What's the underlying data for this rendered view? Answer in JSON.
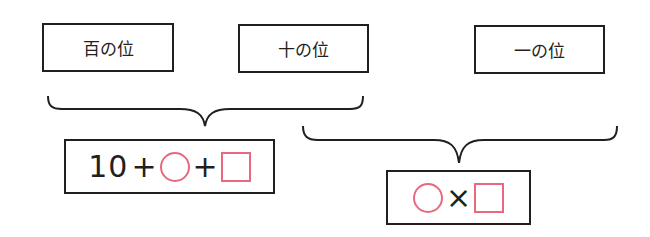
{
  "places": [
    {
      "label": "百の位"
    },
    {
      "label": "十の位"
    },
    {
      "label": "一の位"
    }
  ],
  "expressions": {
    "upper": {
      "number": "10",
      "op1": "+",
      "shape1": "circle",
      "op2": "+",
      "shape2": "square"
    },
    "lower": {
      "shape1": "circle",
      "op1": "×",
      "shape2": "square"
    }
  },
  "colors": {
    "line": "#231f20",
    "shape": "#e8687f"
  }
}
